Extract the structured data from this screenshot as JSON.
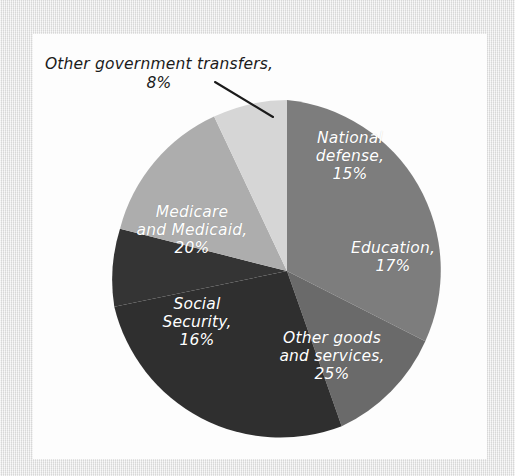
{
  "chart_data": {
    "type": "pie",
    "title": "",
    "subtitle": "",
    "xlabel": "",
    "ylabel": "",
    "legend_position": "none",
    "grid": false,
    "labels_inside": true,
    "start_angle_deg": 0,
    "direction": "clockwise",
    "units": "percent",
    "total": 101,
    "categories": [
      "National defense",
      "Education",
      "Other goods and services",
      "Social Security",
      "Medicare and Medicaid",
      "Other government transfers"
    ],
    "values": [
      15,
      17,
      25,
      16,
      20,
      8
    ],
    "slices": [
      {
        "name": "National defense",
        "label": "National\ndefense,\n15%",
        "value": 15,
        "percent": "15%",
        "color": "#7d7d7d",
        "text_color": "#ffffff",
        "label_placement": "inside"
      },
      {
        "name": "Education",
        "label": "Education,\n17%",
        "value": 17,
        "percent": "17%",
        "color": "#6a6a6a",
        "text_color": "#ffffff",
        "label_placement": "inside"
      },
      {
        "name": "Other goods and services",
        "label": "Other goods\nand services,\n25%",
        "value": 25,
        "percent": "25%",
        "color": "#2f2f2f",
        "text_color": "#ffffff",
        "label_placement": "inside"
      },
      {
        "name": "Social Security",
        "label": "Social\nSecurity,\n16%",
        "value": 16,
        "percent": "16%",
        "color": "#343434",
        "text_color": "#ffffff",
        "label_placement": "inside"
      },
      {
        "name": "Medicare and Medicaid",
        "label": "Medicare\nand Medicaid,\n20%",
        "value": 20,
        "percent": "20%",
        "color": "#adadad",
        "text_color": "#ffffff",
        "label_placement": "inside"
      },
      {
        "name": "Other government transfers",
        "label": "Other government transfers,\n8%",
        "value": 8,
        "percent": "8%",
        "color": "#d6d6d6",
        "text_color": "#1b1b1b",
        "label_placement": "outside-callout"
      }
    ],
    "annotations": [
      {
        "name": "leader-line",
        "from_label": "Other government transfers",
        "points": "215,82 273,117"
      }
    ]
  },
  "figure": {
    "background_color": "#e8e8e8",
    "canvas_color": "#fdfdfd",
    "leader_line_color": "#1b1b1b"
  }
}
